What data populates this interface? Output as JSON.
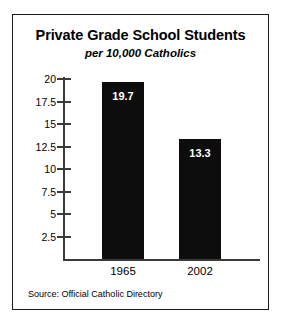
{
  "chart_data": {
    "type": "bar",
    "title": "Private Grade School Students",
    "subtitle": "per 10,000 Catholics",
    "categories": [
      "1965",
      "2002"
    ],
    "values": [
      19.7,
      13.3
    ],
    "value_labels": [
      "19.7",
      "13.3"
    ],
    "xlabel": "",
    "ylabel": "",
    "ylim": [
      0,
      21
    ],
    "yticks": [
      20,
      17.5,
      15,
      12.5,
      10,
      7.5,
      5,
      2.5
    ],
    "ytick_labels": [
      "20",
      "17.5",
      "15",
      "12.5",
      "10",
      "7.5",
      "5",
      "2.5"
    ],
    "grid": false,
    "legend": false,
    "bar_color": "#0d0d0d",
    "value_label_color": "#ffffff",
    "axis_color": "#3a3a3a",
    "border_color": "#1a1a1a",
    "background": "#ffffff",
    "source": "Source: Official Catholic Directory"
  }
}
